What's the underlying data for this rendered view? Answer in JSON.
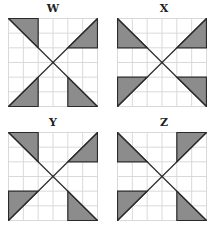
{
  "colors": {
    "background": "#ffffff",
    "grid_line": "#d9d9d9",
    "shade_fill": "#8c8c8c",
    "outline": "#2a2a2a"
  },
  "grid_size": 6,
  "panels": [
    {
      "label": "W",
      "triangles": [
        [
          [
            0,
            0
          ],
          [
            2,
            0
          ],
          [
            2,
            2
          ]
        ],
        [
          [
            6,
            0
          ],
          [
            6,
            2
          ],
          [
            4,
            2
          ]
        ],
        [
          [
            0,
            6
          ],
          [
            2,
            6
          ],
          [
            2,
            4
          ]
        ],
        [
          [
            4,
            4
          ],
          [
            4,
            6
          ],
          [
            6,
            6
          ]
        ]
      ]
    },
    {
      "label": "X",
      "triangles": [
        [
          [
            0,
            0
          ],
          [
            0,
            2
          ],
          [
            2,
            2
          ]
        ],
        [
          [
            6,
            0
          ],
          [
            6,
            2
          ],
          [
            4,
            2
          ]
        ],
        [
          [
            0,
            4
          ],
          [
            2,
            4
          ],
          [
            0,
            6
          ]
        ],
        [
          [
            4,
            4
          ],
          [
            6,
            4
          ],
          [
            6,
            6
          ]
        ]
      ]
    },
    {
      "label": "Y",
      "triangles": [
        [
          [
            0,
            0
          ],
          [
            2,
            0
          ],
          [
            2,
            2
          ]
        ],
        [
          [
            6,
            0
          ],
          [
            6,
            2
          ],
          [
            4,
            2
          ]
        ],
        [
          [
            0,
            4
          ],
          [
            2,
            4
          ],
          [
            0,
            6
          ]
        ],
        [
          [
            4,
            4
          ],
          [
            4,
            6
          ],
          [
            6,
            6
          ]
        ]
      ]
    },
    {
      "label": "Z",
      "triangles": [
        [
          [
            0,
            0
          ],
          [
            0,
            2
          ],
          [
            2,
            2
          ]
        ],
        [
          [
            4,
            0
          ],
          [
            6,
            0
          ],
          [
            4,
            2
          ]
        ],
        [
          [
            0,
            4
          ],
          [
            2,
            4
          ],
          [
            0,
            6
          ]
        ],
        [
          [
            4,
            4
          ],
          [
            4,
            6
          ],
          [
            6,
            6
          ]
        ]
      ]
    }
  ]
}
